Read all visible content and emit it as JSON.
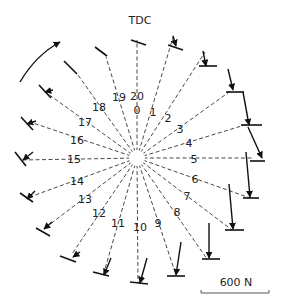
{
  "diagram": {
    "title": "TDC",
    "scale_label": "600 N",
    "scale_length_px": 68,
    "center": [
      137,
      158
    ],
    "positions": [
      {
        "label": "0",
        "end": [
          137,
          22
        ],
        "foot_dir": 15,
        "force": [
          0,
          0
        ]
      },
      {
        "label": "1",
        "end": [
          176,
          22
        ],
        "foot_dir": 20,
        "force": [
          -4,
          -16
        ]
      },
      {
        "label": "2",
        "end": [
          207,
          38
        ],
        "foot_dir": 0,
        "force": [
          -2,
          -20
        ]
      },
      {
        "label": "3",
        "end": [
          233,
          66
        ],
        "foot_dir": 0,
        "force": [
          -5,
          -25
        ]
      },
      {
        "label": "4",
        "end": [
          250,
          102
        ],
        "foot_dir": 0,
        "force": [
          -10,
          -48
        ]
      },
      {
        "label": "5",
        "end": [
          260,
          158
        ],
        "foot_dir": 0,
        "force": [
          -14,
          -47
        ]
      },
      {
        "label": "6",
        "end": [
          250,
          198
        ],
        "foot_dir": 0,
        "force": [
          -10,
          -47
        ]
      },
      {
        "label": "7",
        "end": [
          232,
          230
        ],
        "foot_dir": 0,
        "force": [
          -7,
          -46
        ]
      },
      {
        "label": "8",
        "end": [
          207,
          259
        ],
        "foot_dir": 0,
        "force": [
          0,
          -38
        ]
      },
      {
        "label": "9",
        "end": [
          176,
          275
        ],
        "foot_dir": 0,
        "force": [
          5,
          -34
        ]
      },
      {
        "label": "10",
        "end": [
          138,
          283
        ],
        "foot_dir": 6,
        "force": [
          10,
          -28
        ]
      },
      {
        "label": "11",
        "end": [
          103,
          276
        ],
        "foot_dir": 8,
        "force": [
          8,
          -20
        ]
      },
      {
        "label": "12",
        "end": [
          72,
          254
        ],
        "foot_dir": 15,
        "force": [
          5,
          -6
        ]
      },
      {
        "label": "13",
        "end": [
          45,
          228
        ],
        "foot_dir": 20,
        "force": [
          8,
          -6
        ]
      },
      {
        "label": "14",
        "end": [
          27,
          198
        ],
        "foot_dir": 30,
        "force": [
          10,
          -6
        ]
      },
      {
        "label": "15",
        "end": [
          20,
          160
        ],
        "foot_dir": 45,
        "force": [
          10,
          -5
        ]
      },
      {
        "label": "16",
        "end": [
          27,
          121
        ],
        "foot_dir": 40,
        "force": [
          10,
          -3
        ]
      },
      {
        "label": "17",
        "end": [
          45,
          89
        ],
        "foot_dir": 40,
        "force": [
          9,
          -1
        ]
      },
      {
        "label": "18",
        "end": [
          76,
          72
        ],
        "foot_dir": 45,
        "force": [
          0,
          0
        ]
      },
      {
        "label": "19",
        "end": [
          106,
          55
        ],
        "foot_dir": 35,
        "force": [
          0,
          0
        ]
      },
      {
        "label": "20",
        "end": [
          137,
          22
        ],
        "foot_dir": 15,
        "force": [
          0,
          0
        ]
      }
    ],
    "rotation_arrow": "clockwise-arc"
  }
}
